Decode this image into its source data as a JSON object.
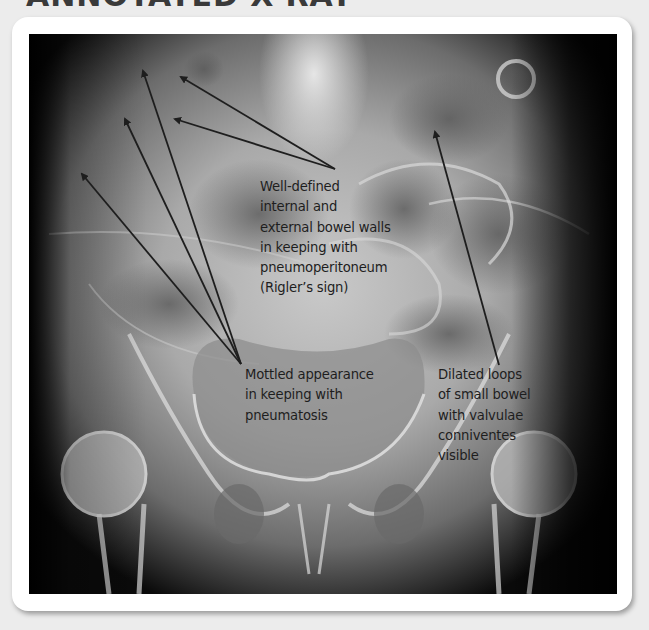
{
  "page": {
    "title": "ANNOTATED X-RAY",
    "background_color": "#ececec",
    "card_color": "#ffffff"
  },
  "image": {
    "subject": "abdominal-pelvic-xray",
    "annotation_color": "#1e1e1e"
  },
  "annotations": [
    {
      "id": "riglers-sign",
      "text": "Well-defined\ninternal and\nexternal bowel walls\nin keeping with\npneumoperitoneum\n(Rigler’s sign)",
      "arrow_count": 2
    },
    {
      "id": "pneumatosis",
      "text": "Mottled appearance\nin keeping with\npneumatosis",
      "arrow_count": 3
    },
    {
      "id": "dilated-loops",
      "text": "Dilated loops\nof small bowel\nwith valvulae\nconniventes\nvisible",
      "arrow_count": 1
    }
  ]
}
